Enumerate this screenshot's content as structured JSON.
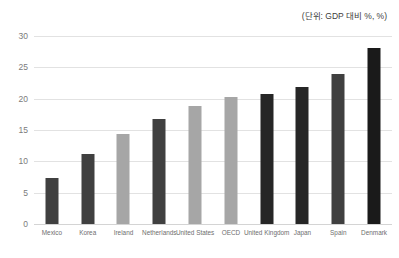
{
  "annotation": {
    "unit_note": "(단위: GDP 대비 %, %)"
  },
  "chart_data": {
    "type": "bar",
    "title": "",
    "subtitle": "",
    "xlabel": "",
    "ylabel": "",
    "ylim": [
      0,
      30
    ],
    "yticks": [
      "0",
      "5",
      "10",
      "15",
      "20",
      "25",
      "30"
    ],
    "ytick_values": [
      0,
      5,
      10,
      15,
      20,
      25,
      30
    ],
    "grid": true,
    "legend": false,
    "legend_position": "none",
    "categories": [
      "Mexico",
      "Korea",
      "Ireland",
      "Netherlands",
      "United States",
      "OECD",
      "United Kingdom",
      "Japan",
      "Spain",
      "Denmark"
    ],
    "values": [
      7.4,
      11.1,
      14.3,
      16.7,
      18.8,
      20.2,
      20.7,
      21.9,
      23.9,
      28.1
    ],
    "colors": [
      "#404040",
      "#404040",
      "#a6a6a6",
      "#404040",
      "#a6a6a6",
      "#a6a6a6",
      "#262626",
      "#262626",
      "#404040",
      "#1a1a1a"
    ],
    "bar_color_dark": "#404040",
    "bar_color_light": "#a6a6a6",
    "bar_color_darkest": "#1a1a1a",
    "gridline_color": "#e2e2e2",
    "axis_text_color": "#7b7b7b"
  }
}
